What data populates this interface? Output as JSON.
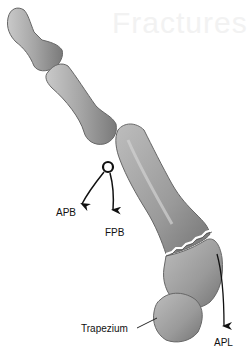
{
  "figure": {
    "watermark": "Fractures",
    "labels": {
      "apb": "APB",
      "fpb": "FPB",
      "apl": "APL",
      "trapezium": "Trapezium"
    },
    "colors": {
      "bone_fill": "#a9a9a9",
      "bone_shadow": "#6f6f6f",
      "bone_highlight": "#d4d4d4",
      "outline": "#555555",
      "arrow": "#111111",
      "fracture_line": "#ffffff"
    }
  }
}
